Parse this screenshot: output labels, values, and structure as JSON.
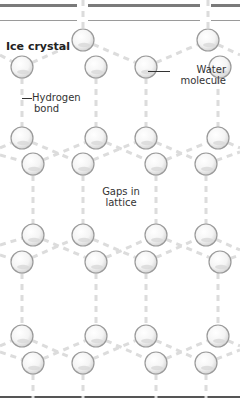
{
  "diagram": {
    "title": "Ice crystal",
    "labels": {
      "water_molecule": [
        "Water",
        "molecule"
      ],
      "hydrogen_bond": [
        "Hydrogen",
        "bond"
      ],
      "gaps": [
        "Gaps in",
        "lattice"
      ]
    },
    "colors": {
      "bar": "#7a7a7a",
      "thin_bar": "#9a9a9a",
      "bond": "#dcdcdc",
      "molecule_stroke": "#9a9a9a",
      "molecule_fill": "#ffffff",
      "molecule_shade": "#d8d8d8"
    },
    "molecules": [
      [
        83,
        40
      ],
      [
        208,
        40
      ],
      [
        22,
        67
      ],
      [
        96,
        67
      ],
      [
        146,
        67
      ],
      [
        220,
        67
      ],
      [
        22,
        138
      ],
      [
        96,
        138
      ],
      [
        146,
        138
      ],
      [
        218,
        138
      ],
      [
        33,
        164
      ],
      [
        83,
        164
      ],
      [
        156,
        164
      ],
      [
        206,
        164
      ],
      [
        33,
        235
      ],
      [
        83,
        235
      ],
      [
        156,
        235
      ],
      [
        206,
        235
      ],
      [
        22,
        262
      ],
      [
        96,
        262
      ],
      [
        146,
        262
      ],
      [
        220,
        262
      ],
      [
        22,
        336
      ],
      [
        96,
        336
      ],
      [
        146,
        336
      ],
      [
        218,
        336
      ],
      [
        33,
        363
      ],
      [
        83,
        363
      ],
      [
        156,
        363
      ],
      [
        206,
        363
      ]
    ]
  }
}
